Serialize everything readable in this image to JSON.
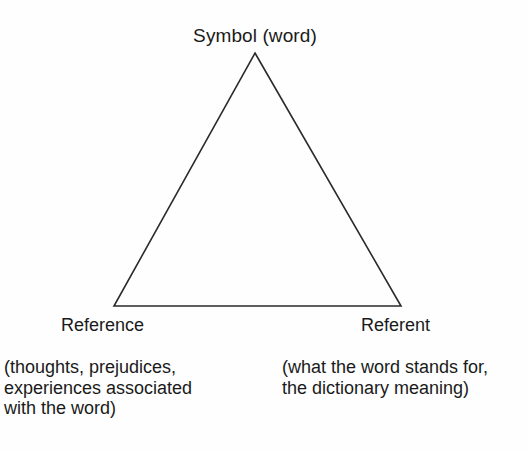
{
  "figure": {
    "name": "semiotic-triangle",
    "background_color": "#fefefe",
    "stroke_color": "#2b2b2b",
    "text_color": "#1a1a1a"
  },
  "apex": {
    "label": "Symbol (word)"
  },
  "left_vertex": {
    "label": "Reference",
    "gloss_lines": [
      "(thoughts, prejudices,",
      "experiences associated",
      "with the word)"
    ]
  },
  "right_vertex": {
    "label": "Referent",
    "gloss_lines": [
      "(what the word stands for,",
      "the dictionary meaning)"
    ]
  },
  "geometry": {
    "apex_point": "255,53",
    "bottom_left_point": "114,306",
    "bottom_right_point": "401,306",
    "stroke_width": "1.6"
  }
}
